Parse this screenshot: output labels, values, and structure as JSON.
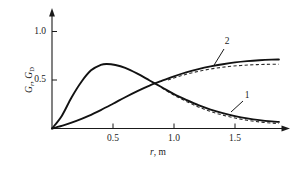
{
  "chart_data": {
    "type": "line",
    "title": "",
    "xlabel": "r, m",
    "ylabel": "Gr, GD",
    "xlim": [
      0,
      1.9
    ],
    "ylim": [
      0,
      1.18
    ],
    "grid": false,
    "legend_position": "inline-callout",
    "xticks": [
      0.5,
      1.0,
      1.5
    ],
    "xtick_labels": [
      "0.5",
      "1.0",
      "1.5"
    ],
    "yticks": [
      0.5,
      1.0
    ],
    "ytick_labels": [
      "0.5",
      "1.0"
    ],
    "annotations": [
      {
        "text": "1",
        "x": 1.72,
        "y": 0.3
      },
      {
        "text": "2",
        "x": 1.52,
        "y": 0.92
      }
    ],
    "series": [
      {
        "name": "1",
        "style": "solid",
        "x": [
          0.0,
          0.08,
          0.16,
          0.24,
          0.32,
          0.4,
          0.45,
          0.52,
          0.6,
          0.7,
          0.8,
          0.9,
          1.0,
          1.1,
          1.2,
          1.3,
          1.4,
          1.5,
          1.6,
          1.7,
          1.8,
          1.86
        ],
        "y": [
          0.0,
          0.13,
          0.32,
          0.48,
          0.6,
          0.655,
          0.665,
          0.655,
          0.625,
          0.565,
          0.495,
          0.425,
          0.355,
          0.295,
          0.24,
          0.195,
          0.158,
          0.128,
          0.104,
          0.086,
          0.073,
          0.068
        ]
      },
      {
        "name": "1-dashed",
        "style": "dashed",
        "x": [
          0.9,
          1.0,
          1.1,
          1.2,
          1.3,
          1.4,
          1.5,
          1.6,
          1.7,
          1.8,
          1.86
        ],
        "y": [
          0.418,
          0.344,
          0.28,
          0.222,
          0.175,
          0.138,
          0.108,
          0.085,
          0.068,
          0.056,
          0.051
        ]
      },
      {
        "name": "2",
        "style": "solid",
        "x": [
          0.0,
          0.1,
          0.2,
          0.3,
          0.4,
          0.5,
          0.6,
          0.7,
          0.8,
          0.9,
          1.0,
          1.1,
          1.2,
          1.3,
          1.4,
          1.5,
          1.6,
          1.7,
          1.8,
          1.86
        ],
        "y": [
          0.0,
          0.035,
          0.078,
          0.13,
          0.19,
          0.255,
          0.322,
          0.385,
          0.443,
          0.492,
          0.538,
          0.578,
          0.612,
          0.64,
          0.663,
          0.682,
          0.695,
          0.704,
          0.71,
          0.712
        ]
      },
      {
        "name": "2-dashed",
        "style": "dashed",
        "x": [
          0.95,
          1.05,
          1.15,
          1.25,
          1.35,
          1.45,
          1.55,
          1.65,
          1.75,
          1.86
        ],
        "y": [
          0.5,
          0.541,
          0.575,
          0.602,
          0.623,
          0.639,
          0.65,
          0.657,
          0.661,
          0.663
        ]
      }
    ],
    "crossing_point": {
      "x": 0.85,
      "y": 0.46
    }
  },
  "axis": {
    "y_label_main": "G",
    "y_label_sub_1": "r",
    "y_label_comma": ", ",
    "y_label_main_2": "G",
    "y_label_sub_2": "D",
    "x_label_var": "r",
    "x_label_unit": ", m"
  }
}
